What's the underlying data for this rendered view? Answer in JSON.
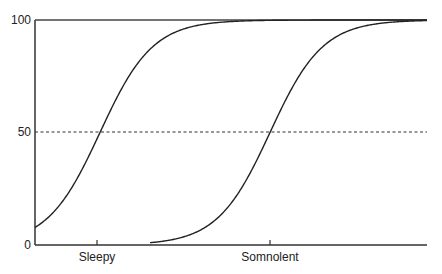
{
  "chart_data": {
    "type": "line",
    "title": "",
    "xlabel": "",
    "ylabel": "",
    "ylim": [
      0,
      100
    ],
    "y_ticks": [
      "0",
      "50",
      "100"
    ],
    "x_ticks": [
      {
        "label": "Sleepy",
        "x": 100
      },
      {
        "label": "Somnolent",
        "x": 270
      }
    ],
    "reference_line": {
      "y": 50,
      "style": "dashed"
    },
    "series": [
      {
        "name": "curve-sleepy",
        "midpoint_x": 100,
        "start_value": 6,
        "end_value": 100
      },
      {
        "name": "curve-somnolent",
        "midpoint_x": 270,
        "start_value": 0,
        "end_value": 100
      }
    ],
    "grid": false,
    "legend": null
  },
  "labels": {
    "y0": "0",
    "y50": "50",
    "y100": "100",
    "x1": "Sleepy",
    "x2": "Somnolent"
  }
}
